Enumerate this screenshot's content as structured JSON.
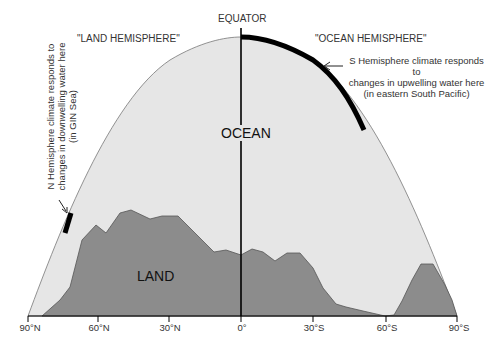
{
  "diagram": {
    "equator_label": "EQUATOR",
    "land_hemisphere_label": "\"LAND HEMISPHERE\"",
    "ocean_hemisphere_label": "\"OCEAN HEMISPHERE\"",
    "ocean_label": "OCEAN",
    "land_label": "LAND",
    "south_note": [
      "S Hemisphere climate responds to",
      "changes in upwelling water here",
      "(in eastern South Pacific)"
    ],
    "north_note": [
      "N Hemisphere climate responds to",
      "changes in downwelling water here",
      "(in GIN Sea)"
    ],
    "x_axis_ticks": [
      "90°N",
      "60°N",
      "30°N",
      "0°",
      "30°S",
      "60°S",
      "90°S"
    ],
    "colors": {
      "ocean_fill": "#e6e6e6",
      "land_fill": "#8c8c8c",
      "outline": "#555555",
      "highlight": "#000000"
    }
  }
}
